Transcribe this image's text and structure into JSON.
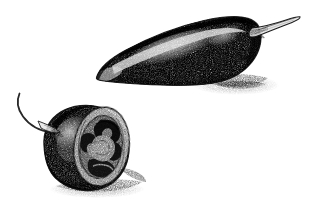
{
  "artwork": {
    "title": "Jalapeno Pepper Botanical Illustration",
    "subject": "jalapeno pepper",
    "medium": "pen-and-ink stipple drawing",
    "style": "black and white stippled botanical illustration",
    "background_color": "#ffffff",
    "ink_color": "#1a1a1a",
    "canvas": {
      "width": 318,
      "height": 207
    }
  },
  "subjects": [
    {
      "id": "whole-pepper",
      "label": "Whole jalapeno pepper",
      "description": "Elongated tapering pepper pod lying diagonally, tip pointing to the lower left, shoulder and stem at the upper right",
      "orientation": "diagonal, tip lower-left to stem upper-right",
      "parts": [
        {
          "id": "pepper-body",
          "label": "Pepper body"
        },
        {
          "id": "pepper-tip",
          "label": "Pointed tip"
        },
        {
          "id": "pepper-highlight",
          "label": "Light highlight band"
        },
        {
          "id": "pepper-calyx",
          "label": "Calyx"
        },
        {
          "id": "pepper-stem",
          "label": "Stem"
        },
        {
          "id": "pepper-shadow",
          "label": "Cast shadow"
        }
      ]
    },
    {
      "id": "halved-pepper",
      "label": "Halved jalapeno pepper",
      "description": "Cut pepper section showing the hollow interior with pale placenta and seeds, stem curving up and to the left",
      "orientation": "cut face angled to the right",
      "parts": [
        {
          "id": "half-body",
          "label": "Cut pepper body"
        },
        {
          "id": "half-cut-face",
          "label": "Cut cross-section face"
        },
        {
          "id": "half-flesh-wall",
          "label": "Pale flesh wall ring"
        },
        {
          "id": "half-cavity",
          "label": "Dark inner cavity"
        },
        {
          "id": "half-placenta",
          "label": "Placenta and seeds"
        },
        {
          "id": "half-stem",
          "label": "Curved stem"
        },
        {
          "id": "half-shadow",
          "label": "Cast shadow"
        }
      ]
    }
  ],
  "palette": {
    "paper": "#ffffff",
    "ink_dark": "#141414",
    "ink_mid": "#5a5a5a",
    "ink_light": "#a8a8a8",
    "shadow": "#8f8f8f"
  }
}
